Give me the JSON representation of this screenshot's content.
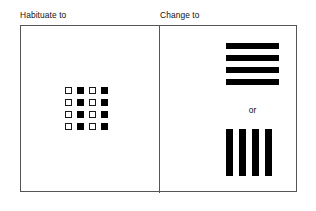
{
  "figure": {
    "background_color": "#ffffff",
    "frame_border_color": "#555555",
    "ink_color": "#000000"
  },
  "columns": {
    "left_caption": "Habituate to",
    "right_caption": "Change to"
  },
  "habituate_panel": {
    "name": "checkerboard-stimulus",
    "rows": 4,
    "columns": 4,
    "cell_states": [
      [
        "open",
        "filled",
        "open",
        "filled"
      ],
      [
        "open",
        "filled",
        "open",
        "filled"
      ],
      [
        "open",
        "filled",
        "open",
        "filled"
      ],
      [
        "open",
        "filled",
        "open",
        "filled"
      ]
    ]
  },
  "change_panel": {
    "connector_label": "or",
    "horizontal_bars": {
      "name": "horizontal-stripes-stimulus",
      "count": 4
    },
    "vertical_bars": {
      "name": "vertical-stripes-stimulus",
      "count": 4
    }
  }
}
